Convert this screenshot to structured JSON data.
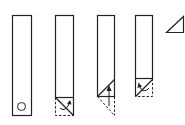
{
  "diagram": {
    "title": "",
    "stroke_color": "#222222",
    "background": "#ffffff",
    "steps": [
      {
        "id": 1,
        "label": "",
        "feature": "circle-marker"
      },
      {
        "id": 2,
        "label": "",
        "feature": "diagonal-fold-with-curved-arrow"
      },
      {
        "id": 3,
        "label": "",
        "feature": "fold-up-with-straight-arrow"
      },
      {
        "id": 4,
        "label": "",
        "feature": "fold-with-curved-arrow"
      },
      {
        "id": 5,
        "label": "",
        "feature": "result-triangle"
      }
    ]
  }
}
